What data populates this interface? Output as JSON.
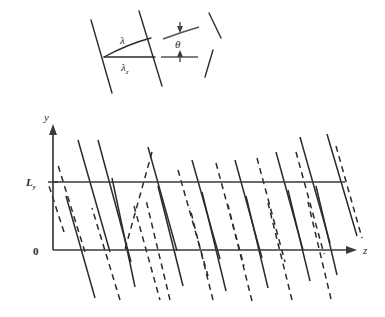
{
  "figure": {
    "type": "scientific-diagram",
    "background_color": "#ffffff",
    "line_color": "#2b2b2b",
    "axis_color": "#3a3a3a"
  },
  "inset": {
    "name": "wavefront-geometry-inset",
    "labels": {
      "lambda": "λ",
      "lambda_z_base": "λ",
      "lambda_z_sub": "z",
      "theta": "θ"
    },
    "wavefronts": [
      {
        "name": "wavefront-left",
        "x1": 91,
        "y1": 20,
        "x2": 112,
        "y2": 93
      },
      {
        "name": "wavefront-right",
        "x1": 139,
        "y1": 11,
        "x2": 162,
        "y2": 86
      }
    ],
    "measure_lines": [
      {
        "name": "lambda-slant-line",
        "x1": 104,
        "y1": 57,
        "x2": 151,
        "y2": 38
      },
      {
        "name": "lambda-z-horizontal-line",
        "x1": 104,
        "y1": 57,
        "x2": 155,
        "y2": 57
      }
    ],
    "angle_marks": [
      {
        "name": "theta-upper-line",
        "x1": 163,
        "y1": 38,
        "x2": 199,
        "y2": 28
      },
      {
        "name": "theta-lower-line",
        "x1": 161,
        "y1": 57,
        "x2": 198,
        "y2": 57
      }
    ],
    "brackets": [
      {
        "name": "bracket-upper-tick",
        "x1": 209,
        "y1": 13,
        "x2": 220,
        "y2": 37
      },
      {
        "name": "bracket-lower-tick",
        "x1": 212,
        "y1": 50,
        "x2": 206,
        "y2": 76
      }
    ]
  },
  "main_plot": {
    "name": "ray-path-plot",
    "axes": {
      "y_axis_label": "y",
      "z_axis_label": "z",
      "origin_label": "0",
      "ly_label_base": "L",
      "ly_label_sub": "y",
      "y_axis_x": 53,
      "y_axis_top": 126,
      "y_axis_bottom": 250,
      "z_axis_y": 250,
      "z_axis_left": 53,
      "z_axis_right": 355,
      "ly_line_y": 182,
      "ly_line_right": 345
    },
    "ray_slope_note": "steep rays alternating solid and dashed, zigzag reflecting between y=0 and y=Ly",
    "solid_rays": [
      [
        66,
        196,
        95,
        298
      ],
      [
        110,
        252,
        78,
        140
      ],
      [
        98,
        140,
        131,
        262
      ],
      [
        135,
        287,
        112,
        178
      ],
      [
        148,
        147,
        177,
        251
      ],
      [
        183,
        286,
        158,
        186
      ],
      [
        192,
        160,
        220,
        259
      ],
      [
        226,
        291,
        202,
        192
      ],
      [
        235,
        160,
        262,
        258
      ],
      [
        268,
        288,
        246,
        196
      ],
      [
        276,
        152,
        303,
        250
      ],
      [
        310,
        281,
        288,
        190
      ],
      [
        300,
        137,
        330,
        243
      ],
      [
        337,
        275,
        316,
        186
      ],
      [
        327,
        134,
        357,
        236
      ]
    ],
    "dashed_rays": [
      [
        85,
        252,
        57,
        162
      ],
      [
        120,
        300,
        92,
        208
      ],
      [
        134,
        206,
        160,
        300
      ],
      [
        152,
        152,
        124,
        253
      ],
      [
        170,
        300,
        146,
        200
      ],
      [
        178,
        170,
        208,
        276
      ],
      [
        213,
        300,
        190,
        208
      ],
      [
        216,
        163,
        244,
        266
      ],
      [
        252,
        301,
        228,
        205
      ],
      [
        257,
        158,
        285,
        262
      ],
      [
        292,
        300,
        268,
        203
      ],
      [
        296,
        152,
        324,
        254
      ],
      [
        331,
        299,
        308,
        202
      ],
      [
        336,
        146,
        362,
        238
      ],
      [
        64,
        232,
        49,
        186
      ]
    ]
  }
}
